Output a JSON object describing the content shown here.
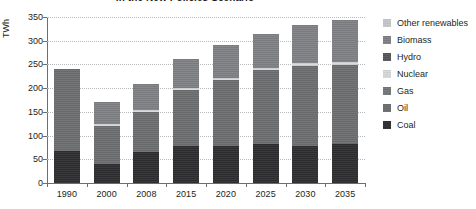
{
  "chart_data": {
    "type": "bar",
    "stacked": true,
    "title": "in the New Policies Scenario",
    "xlabel": "",
    "ylabel": "TWh",
    "ylim": [
      0,
      350
    ],
    "ytick_step": 50,
    "yticks": [
      "0",
      "50",
      "100",
      "150",
      "200",
      "250",
      "300",
      "350"
    ],
    "grid": true,
    "legend_position": "right",
    "categories": [
      "1990",
      "2000",
      "2008",
      "2015",
      "2020",
      "2025",
      "2030",
      "2035"
    ],
    "series": [
      {
        "name": "Coal",
        "color": "#2f2f31",
        "values": [
          68,
          40,
          65,
          78,
          79,
          82,
          78,
          82
        ]
      },
      {
        "name": "Oil",
        "color": "#6e6f71",
        "values": [
          172,
          80,
          84,
          119,
          138,
          156,
          169,
          167
        ]
      },
      {
        "name": "Gas",
        "color": "#76777a",
        "values": [
          0,
          0,
          0,
          0,
          0,
          0,
          0,
          0
        ]
      },
      {
        "name": "Nuclear",
        "color": "#d8d9da",
        "values": [
          0,
          4,
          4,
          4,
          5,
          5,
          6,
          6
        ]
      },
      {
        "name": "Hydro",
        "color": "#56585b",
        "values": [
          0,
          0,
          0,
          0,
          0,
          0,
          0,
          0
        ]
      },
      {
        "name": "Biomass",
        "color": "#808285",
        "values": [
          0,
          47,
          55,
          60,
          68,
          72,
          80,
          89
        ]
      },
      {
        "name": "Other renewables",
        "color": "#c7c8ca",
        "values": [
          0,
          0,
          0,
          0,
          0,
          0,
          0,
          0
        ]
      }
    ],
    "totals": [
      240,
      171,
      208,
      261,
      290,
      315,
      333,
      344
    ]
  },
  "legend": {
    "items": [
      {
        "label": "Other renewables",
        "color": "#c7c8ca"
      },
      {
        "label": "Biomass",
        "color": "#808285"
      },
      {
        "label": "Hydro",
        "color": "#56585b"
      },
      {
        "label": "Nuclear",
        "color": "#d8d9da"
      },
      {
        "label": "Gas",
        "color": "#76777a"
      },
      {
        "label": "Oil",
        "color": "#6e6f71"
      },
      {
        "label": "Coal",
        "color": "#2f2f31"
      }
    ]
  },
  "axis": {
    "y_title": "TWh"
  }
}
